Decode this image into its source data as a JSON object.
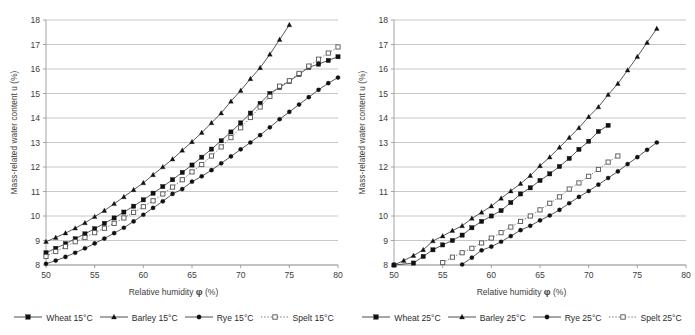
{
  "chart_data": [
    {
      "type": "line",
      "title": "",
      "panel": "left",
      "xlabel": "Relative humidity",
      "xlabel_symbol": "φ",
      "xlabel_unit": "(%)",
      "ylabel": "Mass-related water content  u (%)",
      "xlim": [
        50,
        80
      ],
      "ylim": [
        8,
        18
      ],
      "xticks": [
        50,
        55,
        60,
        65,
        70,
        75,
        80
      ],
      "yticks": [
        8,
        9,
        10,
        11,
        12,
        13,
        14,
        15,
        16,
        17,
        18
      ],
      "grid": "horizontal",
      "legend_position": "bottom",
      "series": [
        {
          "name": "Wheat 15°C",
          "marker": "filled-square",
          "line": "solid",
          "x": [
            50,
            51,
            52,
            53,
            54,
            55,
            56,
            57,
            58,
            59,
            60,
            61,
            62,
            63,
            64,
            65,
            66,
            67,
            68,
            69,
            70,
            71,
            72,
            73,
            74,
            75,
            76,
            77,
            78,
            79,
            80
          ],
          "values": [
            8.5,
            8.68,
            8.87,
            9.07,
            9.27,
            9.48,
            9.7,
            9.92,
            10.16,
            10.4,
            10.66,
            10.93,
            11.2,
            11.48,
            11.78,
            12.08,
            12.4,
            12.73,
            13.07,
            13.43,
            13.8,
            14.2,
            14.6,
            15.0,
            15.25,
            15.5,
            15.78,
            16.07,
            16.2,
            16.35,
            16.5
          ]
        },
        {
          "name": "Barley 15°C",
          "marker": "filled-triangle",
          "line": "solid",
          "x": [
            50,
            51,
            52,
            53,
            54,
            55,
            56,
            57,
            58,
            59,
            60,
            61,
            62,
            63,
            64,
            65,
            66,
            67,
            68,
            69,
            70,
            71,
            72,
            73,
            74,
            75
          ],
          "values": [
            8.95,
            9.12,
            9.3,
            9.5,
            9.72,
            9.97,
            10.22,
            10.5,
            10.78,
            11.07,
            11.35,
            11.68,
            12.0,
            12.32,
            12.68,
            13.03,
            13.4,
            13.8,
            14.2,
            14.68,
            15.12,
            15.6,
            16.05,
            16.6,
            17.2,
            17.8
          ]
        },
        {
          "name": "Rye 15°C",
          "marker": "filled-circle",
          "line": "solid",
          "x": [
            50,
            51,
            52,
            53,
            54,
            55,
            56,
            57,
            58,
            59,
            60,
            61,
            62,
            63,
            64,
            65,
            66,
            67,
            68,
            69,
            70,
            71,
            72,
            73,
            74,
            75,
            76,
            77,
            78,
            79,
            80
          ],
          "values": [
            8.05,
            8.18,
            8.33,
            8.5,
            8.68,
            8.88,
            9.08,
            9.3,
            9.52,
            9.78,
            10.05,
            10.33,
            10.6,
            10.9,
            11.1,
            11.4,
            11.62,
            11.87,
            12.15,
            12.43,
            12.72,
            13.0,
            13.3,
            13.62,
            13.95,
            14.25,
            14.55,
            14.85,
            15.15,
            15.42,
            15.65
          ]
        },
        {
          "name": "Spelt 15°C",
          "marker": "open-square",
          "line": "dotted",
          "x": [
            50,
            51,
            52,
            53,
            54,
            55,
            56,
            57,
            58,
            59,
            60,
            61,
            62,
            63,
            64,
            65,
            66,
            67,
            68,
            69,
            70,
            71,
            72,
            73,
            74,
            75,
            76,
            77,
            78,
            79,
            80
          ],
          "values": [
            8.35,
            8.55,
            8.75,
            8.95,
            9.12,
            9.32,
            9.5,
            9.7,
            9.92,
            10.15,
            10.38,
            10.62,
            10.9,
            11.18,
            11.48,
            11.8,
            12.1,
            12.45,
            12.82,
            13.2,
            13.6,
            14.02,
            14.45,
            14.88,
            15.3,
            15.52,
            15.82,
            16.12,
            16.4,
            16.65,
            16.9
          ]
        }
      ]
    },
    {
      "type": "line",
      "title": "",
      "panel": "right",
      "xlabel": "Relative humidity",
      "xlabel_symbol": "φ",
      "xlabel_unit": "(%)",
      "ylabel": "Mass-related water content  u (%)",
      "xlim": [
        50,
        80
      ],
      "ylim": [
        8,
        18
      ],
      "xticks": [
        50,
        55,
        60,
        65,
        70,
        75,
        80
      ],
      "yticks": [
        8,
        9,
        10,
        11,
        12,
        13,
        14,
        15,
        16,
        17,
        18
      ],
      "grid": "horizontal",
      "legend_position": "bottom",
      "series": [
        {
          "name": "Wheat 25°C",
          "marker": "filled-square",
          "line": "solid",
          "x": [
            50,
            52,
            53,
            54,
            55,
            56,
            57,
            58,
            59,
            60,
            61,
            62,
            63,
            64,
            65,
            66,
            67,
            68,
            69,
            70,
            71,
            72
          ],
          "values": [
            8.0,
            8.08,
            8.35,
            8.62,
            8.82,
            9.0,
            9.22,
            9.52,
            9.78,
            10.0,
            10.22,
            10.55,
            10.9,
            11.15,
            11.45,
            11.72,
            12.02,
            12.35,
            12.72,
            13.05,
            13.45,
            13.7
          ]
        },
        {
          "name": "Barley 25°C",
          "marker": "filled-triangle",
          "line": "solid",
          "x": [
            50,
            51,
            52,
            53,
            54,
            55,
            56,
            57,
            58,
            59,
            60,
            61,
            62,
            63,
            64,
            65,
            66,
            67,
            68,
            69,
            70,
            71,
            72,
            73,
            74,
            75,
            76,
            77
          ],
          "values": [
            8.0,
            8.18,
            8.38,
            8.62,
            8.98,
            9.18,
            9.4,
            9.6,
            9.9,
            10.15,
            10.4,
            10.72,
            11.02,
            11.32,
            11.65,
            12.05,
            12.4,
            12.8,
            13.2,
            13.6,
            14.05,
            14.45,
            14.95,
            15.4,
            15.95,
            16.5,
            17.08,
            17.65
          ]
        },
        {
          "name": "Rye 25°C",
          "marker": "filled-circle",
          "line": "solid",
          "x": [
            57,
            58,
            59,
            60,
            61,
            62,
            63,
            64,
            65,
            66,
            67,
            68,
            69,
            70,
            71,
            72,
            73,
            74,
            75,
            76,
            77
          ],
          "values": [
            8.02,
            8.3,
            8.6,
            8.75,
            8.95,
            9.18,
            9.42,
            9.6,
            9.82,
            10.02,
            10.25,
            10.52,
            10.78,
            11.02,
            11.28,
            11.55,
            11.82,
            12.12,
            12.4,
            12.7,
            13.0
          ]
        },
        {
          "name": "Spelt 25°C",
          "marker": "open-square",
          "line": "dotted",
          "x": [
            55,
            56,
            57,
            58,
            59,
            60,
            61,
            62,
            63,
            64,
            65,
            66,
            67,
            68,
            69,
            70,
            71,
            72,
            73
          ],
          "values": [
            8.1,
            8.32,
            8.5,
            8.68,
            8.9,
            9.1,
            9.32,
            9.55,
            9.78,
            10.0,
            10.25,
            10.52,
            10.78,
            11.1,
            11.35,
            11.62,
            11.9,
            12.2,
            12.45
          ]
        }
      ]
    }
  ],
  "left": {
    "ylabel": "Mass-related water content  u (%)",
    "xlabel": "Relative humidity",
    "xlabel_symbol": "φ",
    "xlabel_unit": "(%)",
    "legend": [
      {
        "label": "Wheat 15°C",
        "marker": "filled-square",
        "line": "solid"
      },
      {
        "label": "Barley 15°C",
        "marker": "filled-triangle",
        "line": "solid"
      },
      {
        "label": "Rye 15°C",
        "marker": "filled-circle",
        "line": "solid"
      },
      {
        "label": "Spelt 15°C",
        "marker": "open-square",
        "line": "dotted"
      }
    ]
  },
  "right": {
    "ylabel": "Mass-related water content  u (%)",
    "xlabel": "Relative humidity",
    "xlabel_symbol": "φ",
    "xlabel_unit": "(%)",
    "legend": [
      {
        "label": "Wheat 25°C",
        "marker": "filled-square",
        "line": "solid"
      },
      {
        "label": "Barley 25°C",
        "marker": "filled-triangle",
        "line": "solid"
      },
      {
        "label": "Rye 25°C",
        "marker": "filled-circle",
        "line": "solid"
      },
      {
        "label": "Spelt 25°C",
        "marker": "open-square",
        "line": "dotted"
      }
    ]
  },
  "colors": {
    "line": "#3a3a3a",
    "marker": "#111111",
    "grid": "#b9b9b9",
    "axis": "#9a9a9a",
    "text": "#3d3d3d"
  }
}
